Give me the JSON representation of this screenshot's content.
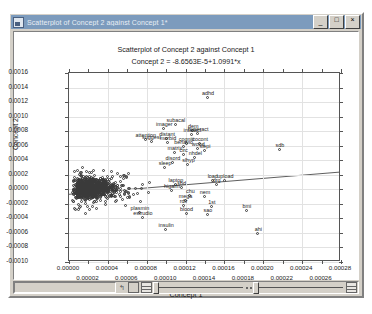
{
  "window": {
    "title": "Scatterplot of Concept 2 against Concept 1*",
    "icon": "chart-icon",
    "minimize_label": "_",
    "maximize_label": "□",
    "close_label": "×"
  },
  "chart_data": {
    "type": "scatter",
    "title": "Scatterplot of Concept 2 against Concept 1",
    "subtitle": "Concept 2 = -8.6563E-5+1.0991*x",
    "xlabel": "Concept 1",
    "ylabel": "Concept 2",
    "xlim": [
      0.0,
      0.00028
    ],
    "ylim": [
      -0.001,
      0.0016
    ],
    "grid": true,
    "legend": "none",
    "regression": {
      "intercept": -8.6563e-05,
      "slope": 1.0991,
      "equation": "Concept 2 = -8.6563E-5+1.0991*x"
    },
    "xticks": [
      0.0,
      2e-05,
      4e-05,
      6e-05,
      8e-05,
      0.0001,
      0.00012,
      0.00014,
      0.00016,
      0.00018,
      0.0002,
      0.00022,
      0.00024,
      0.00026,
      0.00028
    ],
    "xtick_labels_even": [
      "0.00000",
      "0.00004",
      "0.00008",
      "0.00012",
      "0.00016",
      "0.00020",
      "0.00024",
      "0.00028"
    ],
    "xtick_labels_odd": [
      "0.00002",
      "0.00006",
      "0.00010",
      "0.00014",
      "0.00018",
      "0.00022",
      "0.00026"
    ],
    "yticks": [
      0.0016,
      0.0014,
      0.0012,
      0.001,
      0.0008,
      0.0006,
      0.0004,
      0.0002,
      0.0,
      -0.0002,
      -0.0004,
      -0.0006,
      -0.0008,
      -0.001
    ],
    "ytick_labels": [
      "0.0016",
      "0.0014",
      "0.0012",
      "0.0010",
      "0.0008",
      "0.0006",
      "0.0004",
      "0.0002",
      "0.0000",
      "-0.0002",
      "-0.0004",
      "-0.0006",
      "-0.0008",
      "-0.0010"
    ],
    "labeled_points": [
      {
        "label": "adhd",
        "x": 0.000143,
        "y": 0.001255
      },
      {
        "label": "subacal",
        "x": 0.00011,
        "y": 0.000885
      },
      {
        "label": "imager",
        "x": 9.8e-05,
        "y": 0.000835
      },
      {
        "label": "dem",
        "x": 0.000128,
        "y": 0.000805
      },
      {
        "label": "hyperact",
        "x": 0.000133,
        "y": 0.00076
      },
      {
        "label": "interact",
        "x": 0.000127,
        "y": 0.000745
      },
      {
        "label": "attention",
        "x": 7.9e-05,
        "y": 0.000685
      },
      {
        "label": "distant",
        "x": 0.000101,
        "y": 0.00069
      },
      {
        "label": "suggest",
        "x": 8.5e-05,
        "y": 0.00065
      },
      {
        "label": "morbid",
        "x": 0.000102,
        "y": 0.00064
      },
      {
        "label": "cogniti",
        "x": 0.000121,
        "y": 0.000625
      },
      {
        "label": "cocont",
        "x": 0.000135,
        "y": 0.00062
      },
      {
        "label": "behavio",
        "x": 0.000118,
        "y": 0.00058
      },
      {
        "label": "wood",
        "x": 0.000133,
        "y": 0.00056
      },
      {
        "label": "slepi",
        "x": 0.00014,
        "y": 0.000525
      },
      {
        "label": "matrix",
        "x": 0.000109,
        "y": 0.0005
      },
      {
        "label": "circ",
        "x": 0.000118,
        "y": 0.00047
      },
      {
        "label": "nhdel",
        "x": 0.00013,
        "y": 0.000425
      },
      {
        "label": "sdb",
        "x": 0.000217,
        "y": 0.00054
      },
      {
        "label": "disord",
        "x": 0.000107,
        "y": 0.00036
      },
      {
        "label": "slhyp",
        "x": 0.000123,
        "y": 0.00033
      },
      {
        "label": "sleep",
        "x": 9.9e-05,
        "y": 0.0003
      },
      {
        "label": "load",
        "x": 0.000148,
        "y": 0.00012
      },
      {
        "label": "upload",
        "x": 0.000161,
        "y": 0.000115
      },
      {
        "label": "drg",
        "x": 0.000152,
        "y": 6e-05
      },
      {
        "label": "laptop",
        "x": 0.00011,
        "y": 5.5e-05
      },
      {
        "label": "sbd",
        "x": 0.000116,
        "y": 1.5e-05
      },
      {
        "label": "higalm",
        "x": 0.000106,
        "y": -3e-05
      },
      {
        "label": "chu",
        "x": 0.000125,
        "y": -9.5e-05
      },
      {
        "label": "nem",
        "x": 0.00014,
        "y": -0.0001
      },
      {
        "label": "mega",
        "x": 0.00012,
        "y": -0.00016
      },
      {
        "label": "rdir",
        "x": 0.000118,
        "y": -0.000225
      },
      {
        "label": "1st",
        "x": 0.000147,
        "y": -0.00025
      },
      {
        "label": "bmi",
        "x": 0.000183,
        "y": -0.000305
      },
      {
        "label": "plasmin",
        "x": 7.3e-05,
        "y": -0.00032
      },
      {
        "label": "blood",
        "x": 0.000121,
        "y": -0.000335
      },
      {
        "label": "sao",
        "x": 0.000143,
        "y": -0.00036
      },
      {
        "label": "estrudio",
        "x": 7.6e-05,
        "y": -0.0004
      },
      {
        "label": "insulin",
        "x": 0.0001,
        "y": -0.00056
      },
      {
        "label": "ahi",
        "x": 0.000195,
        "y": -0.000615
      }
    ],
    "cluster_note": "dense unlabeled cloud near origin"
  },
  "statusbar": {
    "icons": [
      "arrow-icon",
      "square-icon",
      "grid-icon"
    ],
    "slider_left": "zoom-slider",
    "slider_right": "pan-slider"
  }
}
